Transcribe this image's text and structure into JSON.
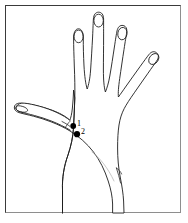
{
  "figure": {
    "background_color": "#ffffff",
    "frame": {
      "visible": true,
      "stroke_color": "#3a3a3a",
      "light_stroke_color": "#8e8e8e",
      "x": 5,
      "y": 5,
      "width": 176,
      "height": 208
    },
    "line_art": {
      "stroke_color": "#1c1c1c",
      "faint_stroke_color": "#b9b9b9",
      "fill_color": "#ffffff"
    },
    "marker_color": "#000000"
  },
  "points": [
    {
      "label": "1",
      "cx": 73.2,
      "cy": 126.0,
      "r": 2.9,
      "label_x": 77,
      "label_y": 120
    },
    {
      "label": "2",
      "cx": 77.0,
      "cy": 134.2,
      "r": 3.1,
      "label_x": 81,
      "label_y": 128
    }
  ],
  "anatomy": {
    "parts": [
      "thumb",
      "index-finger",
      "middle-finger",
      "ring-finger",
      "little-finger",
      "palm-dorsum",
      "wrist"
    ],
    "fingernails": 5
  }
}
